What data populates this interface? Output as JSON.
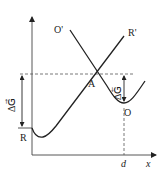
{
  "diagram": {
    "type": "free-energy-curves",
    "axes": {
      "x_label": "x",
      "x_marker": "d"
    },
    "curves": [
      {
        "name": "R-curve",
        "start_label": "R",
        "end_label": "R'"
      },
      {
        "name": "O-curve",
        "start_label": "O'",
        "min_label": "O"
      }
    ],
    "intersection_label": "A",
    "annotations": {
      "left_gap": "ΔG⃗",
      "right_gap": "ΔG⃖"
    }
  }
}
